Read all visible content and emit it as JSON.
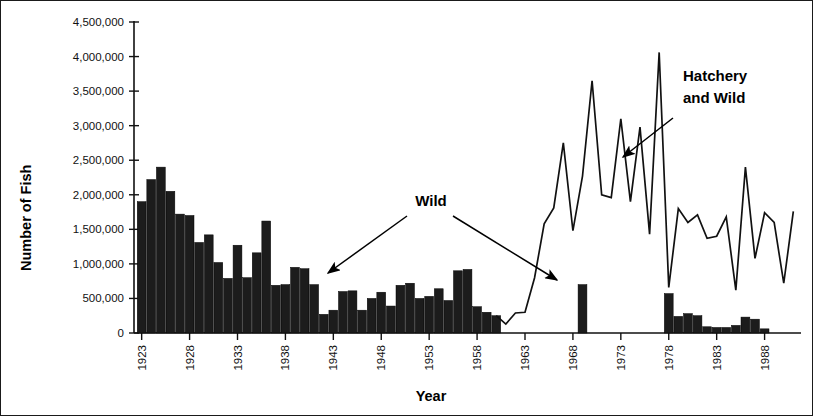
{
  "chart_data": {
    "type": "bar",
    "title": "",
    "xlabel": "Year",
    "ylabel": "Number of Fish",
    "xlim": [
      1922.2,
      1991.8
    ],
    "ylim": [
      0,
      4500000
    ],
    "grid": false,
    "legend_position": "none",
    "y_ticks": [
      0,
      500000,
      1000000,
      1500000,
      2000000,
      2500000,
      3000000,
      3500000,
      4000000,
      4500000
    ],
    "y_tick_labels": [
      "0",
      "500,000",
      "1,000,000",
      "1,500,000",
      "2,000,000",
      "2,500,000",
      "3,000,000",
      "3,500,000",
      "4,000,000",
      "4,500,000"
    ],
    "x_ticks": [
      1923,
      1928,
      1933,
      1938,
      1943,
      1948,
      1953,
      1958,
      1963,
      1968,
      1973,
      1978,
      1983,
      1988
    ],
    "x_tick_labels": [
      "1923",
      "1928",
      "1933",
      "1938",
      "1943",
      "1948",
      "1953",
      "1958",
      "1963",
      "1968",
      "1973",
      "1978",
      "1983",
      "1988"
    ],
    "series": [
      {
        "name": "Wild",
        "type": "bar",
        "color": "#1c1c1c",
        "x": [
          1923,
          1924,
          1925,
          1926,
          1927,
          1928,
          1929,
          1930,
          1931,
          1932,
          1933,
          1934,
          1935,
          1936,
          1937,
          1938,
          1939,
          1940,
          1941,
          1942,
          1943,
          1944,
          1945,
          1946,
          1947,
          1948,
          1949,
          1950,
          1951,
          1952,
          1953,
          1954,
          1955,
          1956,
          1957,
          1958,
          1959,
          1960,
          1969,
          1978,
          1979,
          1980,
          1981,
          1982,
          1983,
          1984,
          1985,
          1986,
          1987,
          1988
        ],
        "values": [
          1900000,
          2220000,
          2400000,
          2050000,
          1720000,
          1700000,
          1310000,
          1420000,
          1020000,
          790000,
          1270000,
          800000,
          1160000,
          1620000,
          690000,
          700000,
          950000,
          930000,
          700000,
          270000,
          330000,
          600000,
          610000,
          330000,
          500000,
          590000,
          390000,
          690000,
          720000,
          500000,
          530000,
          640000,
          470000,
          900000,
          920000,
          380000,
          300000,
          250000,
          700000,
          570000,
          240000,
          280000,
          250000,
          90000,
          80000,
          80000,
          110000,
          230000,
          200000,
          60000
        ]
      },
      {
        "name": "Hatchery and Wild",
        "type": "line",
        "color": "#111111",
        "x": [
          1960,
          1961,
          1962,
          1963,
          1964,
          1965,
          1966,
          1967,
          1968,
          1969,
          1970,
          1971,
          1972,
          1973,
          1974,
          1975,
          1976,
          1977,
          1978,
          1979,
          1980,
          1981,
          1982,
          1983,
          1984,
          1985,
          1986,
          1987,
          1988,
          1989,
          1990,
          1991
        ],
        "values": [
          250000,
          130000,
          290000,
          300000,
          800000,
          1580000,
          1810000,
          2750000,
          1480000,
          2270000,
          3650000,
          2000000,
          1960000,
          3100000,
          1900000,
          2980000,
          1430000,
          4060000,
          660000,
          1800000,
          1600000,
          1710000,
          1370000,
          1400000,
          1680000,
          620000,
          2400000,
          1080000,
          1740000,
          1600000,
          720000,
          1760000
        ]
      }
    ],
    "annotations": [
      {
        "text": "Wild",
        "x": 1952.5,
        "y": 2080000,
        "arrows": 2
      },
      {
        "text": "Hatchery\nand Wild",
        "x": 1983.0,
        "y": 3620000,
        "arrows": 1
      }
    ],
    "annotation_labels": {
      "wild": "Wild",
      "hatchery_line1": "Hatchery",
      "hatchery_line2": "and Wild"
    }
  }
}
